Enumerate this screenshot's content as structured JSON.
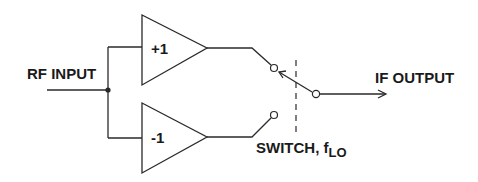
{
  "diagram": {
    "type": "double-balanced-mixer-switch",
    "labels": {
      "rf_input": "RF INPUT",
      "if_output": "IF OUTPUT",
      "switch": "SWITCH, f",
      "switch_subscript": "LO"
    },
    "amplifiers": [
      {
        "name": "non-inverting",
        "gain_label": "+1"
      },
      {
        "name": "inverting",
        "gain_label": "-1"
      }
    ],
    "colors": {
      "stroke": "#2a2a2a",
      "text": "#1a1a1a",
      "background": "#ffffff"
    }
  }
}
